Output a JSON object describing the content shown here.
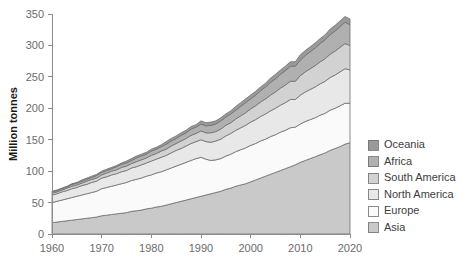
{
  "chart_data": {
    "type": "area",
    "stacked": true,
    "title": "",
    "xlabel": "",
    "ylabel": "Million tonnes",
    "xlim": [
      1960,
      2020
    ],
    "ylim": [
      0,
      350
    ],
    "ytick_step": 50,
    "xtick_step": 10,
    "grid": false,
    "legend_position": "right",
    "x": [
      1960,
      1961,
      1962,
      1963,
      1964,
      1965,
      1966,
      1967,
      1968,
      1969,
      1970,
      1971,
      1972,
      1973,
      1974,
      1975,
      1976,
      1977,
      1978,
      1979,
      1980,
      1981,
      1982,
      1983,
      1984,
      1985,
      1986,
      1987,
      1988,
      1989,
      1990,
      1991,
      1992,
      1993,
      1994,
      1995,
      1996,
      1997,
      1998,
      1999,
      2000,
      2001,
      2002,
      2003,
      2004,
      2005,
      2006,
      2007,
      2008,
      2009,
      2010,
      2011,
      2012,
      2013,
      2014,
      2015,
      2016,
      2017,
      2018,
      2019,
      2020
    ],
    "xticks": [
      1960,
      1970,
      1980,
      1990,
      2000,
      2010,
      2020
    ],
    "yticks": [
      0,
      50,
      100,
      150,
      200,
      250,
      300,
      350
    ],
    "stack_order_bottom_to_top": [
      "Asia",
      "Europe",
      "North America",
      "South America",
      "Africa",
      "Oceania"
    ],
    "series": [
      {
        "name": "Asia",
        "color": "#c9c9c9",
        "values": [
          18,
          19,
          20,
          21,
          22,
          23,
          24,
          25,
          26,
          27,
          29,
          30,
          31,
          32,
          33,
          34,
          36,
          37,
          38,
          40,
          41,
          43,
          44,
          46,
          48,
          50,
          52,
          54,
          56,
          58,
          60,
          62,
          64,
          66,
          68,
          71,
          73,
          76,
          78,
          80,
          83,
          86,
          89,
          92,
          95,
          98,
          101,
          104,
          107,
          110,
          114,
          117,
          120,
          123,
          126,
          129,
          133,
          136,
          139,
          143,
          145
        ]
      },
      {
        "name": "Europe",
        "color": "#fafafa",
        "values": [
          32,
          33,
          34,
          35,
          36,
          37,
          38,
          39,
          40,
          41,
          43,
          44,
          45,
          46,
          47,
          48,
          49,
          50,
          51,
          52,
          53,
          54,
          55,
          56,
          57,
          58,
          59,
          60,
          61,
          62,
          62,
          57,
          53,
          52,
          52,
          53,
          54,
          55,
          56,
          57,
          58,
          58,
          59,
          59,
          60,
          60,
          61,
          61,
          62,
          60,
          61,
          62,
          62,
          62,
          63,
          63,
          64,
          64,
          65,
          65,
          63
        ]
      },
      {
        "name": "North America",
        "color": "#e8e8e8",
        "values": [
          12,
          12,
          13,
          13,
          14,
          14,
          15,
          15,
          16,
          16,
          17,
          17,
          18,
          18,
          19,
          19,
          20,
          20,
          21,
          21,
          22,
          22,
          23,
          23,
          24,
          25,
          25,
          26,
          27,
          27,
          28,
          28,
          29,
          30,
          31,
          32,
          33,
          34,
          35,
          36,
          37,
          38,
          39,
          40,
          41,
          42,
          43,
          44,
          45,
          44,
          46,
          47,
          48,
          49,
          50,
          51,
          52,
          53,
          54,
          55,
          53
        ]
      },
      {
        "name": "South America",
        "color": "#d2d2d2",
        "values": [
          3,
          3,
          3,
          4,
          4,
          4,
          4,
          5,
          5,
          5,
          5,
          6,
          6,
          6,
          7,
          7,
          7,
          8,
          8,
          8,
          9,
          9,
          10,
          10,
          11,
          11,
          12,
          12,
          13,
          13,
          14,
          14,
          15,
          15,
          16,
          17,
          17,
          18,
          19,
          20,
          21,
          22,
          23,
          24,
          25,
          26,
          27,
          28,
          29,
          29,
          31,
          32,
          33,
          34,
          35,
          36,
          37,
          38,
          39,
          40,
          39
        ]
      },
      {
        "name": "Africa",
        "color": "#b0b0b0",
        "values": [
          2,
          2,
          2,
          2,
          3,
          3,
          3,
          3,
          3,
          4,
          4,
          4,
          4,
          5,
          5,
          5,
          5,
          6,
          6,
          6,
          7,
          7,
          7,
          8,
          8,
          8,
          9,
          9,
          10,
          10,
          11,
          11,
          12,
          12,
          13,
          13,
          14,
          14,
          15,
          16,
          16,
          17,
          18,
          19,
          20,
          21,
          22,
          23,
          24,
          24,
          25,
          26,
          27,
          28,
          29,
          30,
          31,
          32,
          33,
          34,
          33
        ]
      },
      {
        "name": "Oceania",
        "color": "#9a9a9a",
        "values": [
          1,
          1,
          1,
          1,
          1,
          1,
          2,
          2,
          2,
          2,
          2,
          2,
          2,
          2,
          2,
          3,
          3,
          3,
          3,
          3,
          3,
          3,
          3,
          4,
          4,
          4,
          4,
          4,
          4,
          4,
          5,
          5,
          5,
          5,
          5,
          5,
          5,
          6,
          6,
          6,
          6,
          6,
          6,
          6,
          7,
          7,
          7,
          7,
          7,
          7,
          8,
          8,
          8,
          8,
          8,
          8,
          9,
          9,
          9,
          9,
          9
        ]
      }
    ],
    "legend_entries": [
      {
        "label": "Oceania",
        "color": "#9a9a9a"
      },
      {
        "label": "Africa",
        "color": "#b0b0b0"
      },
      {
        "label": "South America",
        "color": "#d2d2d2"
      },
      {
        "label": "North America",
        "color": "#e8e8e8"
      },
      {
        "label": "Europe",
        "color": "#fafafa"
      },
      {
        "label": "Asia",
        "color": "#c9c9c9"
      }
    ]
  }
}
